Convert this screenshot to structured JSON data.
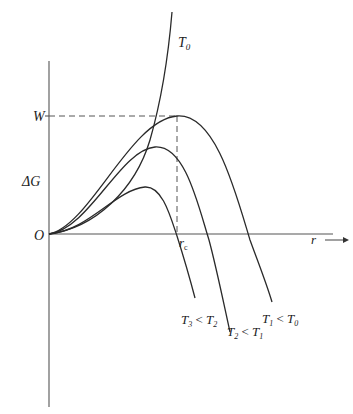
{
  "diagram": {
    "type": "free-energy-vs-radius",
    "axes": {
      "y_label": "ΔG",
      "x_label": "r",
      "origin_label": "O"
    },
    "markers": {
      "barrier_label": "W",
      "critical_radius_label": "r",
      "critical_radius_subscript": "c"
    },
    "curves": [
      {
        "id": "T0",
        "label": "T",
        "sub": "0",
        "label_full": "T0"
      },
      {
        "id": "T1",
        "label": "T",
        "sub": "1",
        "rel": " < ",
        "ref": "T",
        "ref_sub": "0",
        "label_full": "T1 < T0"
      },
      {
        "id": "T2",
        "label": "T",
        "sub": "2",
        "rel": " < ",
        "ref": "T",
        "ref_sub": "1",
        "label_full": "T2 < T1"
      },
      {
        "id": "T3",
        "label": "T",
        "sub": "3",
        "rel": " < ",
        "ref": "T",
        "ref_sub": "2",
        "label_full": "T3 < T2"
      }
    ]
  }
}
